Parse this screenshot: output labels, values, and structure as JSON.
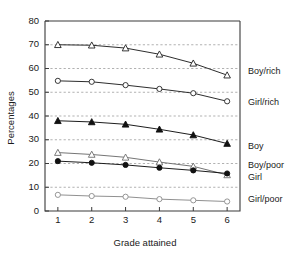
{
  "chart_data": {
    "type": "line",
    "title": "",
    "xlabel": "Grade attained",
    "ylabel": "Percentages",
    "x": [
      1,
      2,
      3,
      4,
      5,
      6
    ],
    "xticklabels": [
      "1",
      "2",
      "3",
      "4",
      "5",
      "6"
    ],
    "yticklabels": [
      "0",
      "10",
      "20",
      "30",
      "40",
      "50",
      "60",
      "70",
      "80"
    ],
    "ylim": [
      0,
      80
    ],
    "xlim": [
      0.62,
      6.38
    ],
    "ytick_step": 10,
    "grid": "horizontal-dashed",
    "legend_position": "right-of-plot-inline",
    "series": [
      {
        "name": "Boy/rich",
        "label": "Boy/rich",
        "marker": "open-triangle",
        "color": "#222222",
        "values": [
          70.0,
          69.8,
          68.6,
          66.0,
          62.2,
          57.2
        ]
      },
      {
        "name": "Girl/rich",
        "label": "Girl/rich",
        "marker": "open-circle",
        "color": "#222222",
        "values": [
          54.8,
          54.4,
          53.0,
          51.4,
          49.6,
          46.2
        ]
      },
      {
        "name": "Boy",
        "label": "Boy",
        "marker": "filled-triangle",
        "color": "#111111",
        "values": [
          38.0,
          37.5,
          36.5,
          34.4,
          32.0,
          28.4
        ]
      },
      {
        "name": "Girl",
        "label": "Girl",
        "marker": "open-triangle",
        "color": "#6e6e6e",
        "values": [
          24.6,
          23.8,
          22.6,
          20.6,
          18.8,
          15.2
        ]
      },
      {
        "name": "Boy/poor",
        "label": "Boy/poor",
        "marker": "filled-circle",
        "color": "#111111",
        "values": [
          21.0,
          20.3,
          19.4,
          18.2,
          17.1,
          15.8
        ]
      },
      {
        "name": "Girl/poor",
        "label": "Girl/poor",
        "marker": "open-circle",
        "color": "#8a8a8a",
        "values": [
          6.8,
          6.3,
          6.0,
          5.0,
          4.5,
          4.0
        ]
      }
    ],
    "annotations": [
      {
        "text": "Boy/rich",
        "y_value": 58.5
      },
      {
        "text": "Girl/rich",
        "y_value": 45.5
      },
      {
        "text": "Boy",
        "y_value": 27.0
      },
      {
        "text": "Boy/poor",
        "y_value": 19.0
      },
      {
        "text": "Girl",
        "y_value": 14.0
      },
      {
        "text": "Girl/poor",
        "y_value": 5.0
      }
    ]
  }
}
